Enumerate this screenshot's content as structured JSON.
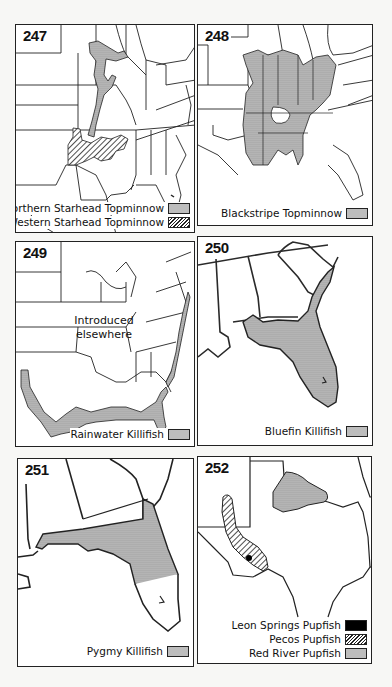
{
  "colors": {
    "stipple_fill": "#bdbdbd",
    "hatch_line": "#222222",
    "solid_fill": "#000000",
    "outline": "#222222",
    "background": "#ffffff"
  },
  "maps": [
    {
      "number": "247",
      "region": "Eastern and central United States",
      "legend": [
        {
          "label": "Northern Starhead Topminnow",
          "pattern": "stipple"
        },
        {
          "label": "Western Starhead Topminnow",
          "pattern": "hatch"
        }
      ]
    },
    {
      "number": "248",
      "region": "Eastern and central United States",
      "legend": [
        {
          "label": "Blackstripe Topminnow",
          "pattern": "stipple"
        }
      ]
    },
    {
      "number": "249",
      "region": "Eastern and central United States",
      "note_line1": "Introduced",
      "note_line2": "elsewhere",
      "legend": [
        {
          "label": "Rainwater Killifish",
          "pattern": "stipple"
        }
      ]
    },
    {
      "number": "250",
      "region": "Southeastern United States / Florida",
      "legend": [
        {
          "label": "Bluefin Killifish",
          "pattern": "stipple"
        }
      ]
    },
    {
      "number": "251",
      "region": "Florida and Gulf coast",
      "legend": [
        {
          "label": "Pygmy Killifish",
          "pattern": "stipple"
        }
      ]
    },
    {
      "number": "252",
      "region": "Texas and New Mexico",
      "legend": [
        {
          "label": "Leon Springs Pupfish",
          "pattern": "solid"
        },
        {
          "label": "Pecos Pupfish",
          "pattern": "hatch"
        },
        {
          "label": "Red River Pupfish",
          "pattern": "stipple"
        }
      ]
    }
  ]
}
